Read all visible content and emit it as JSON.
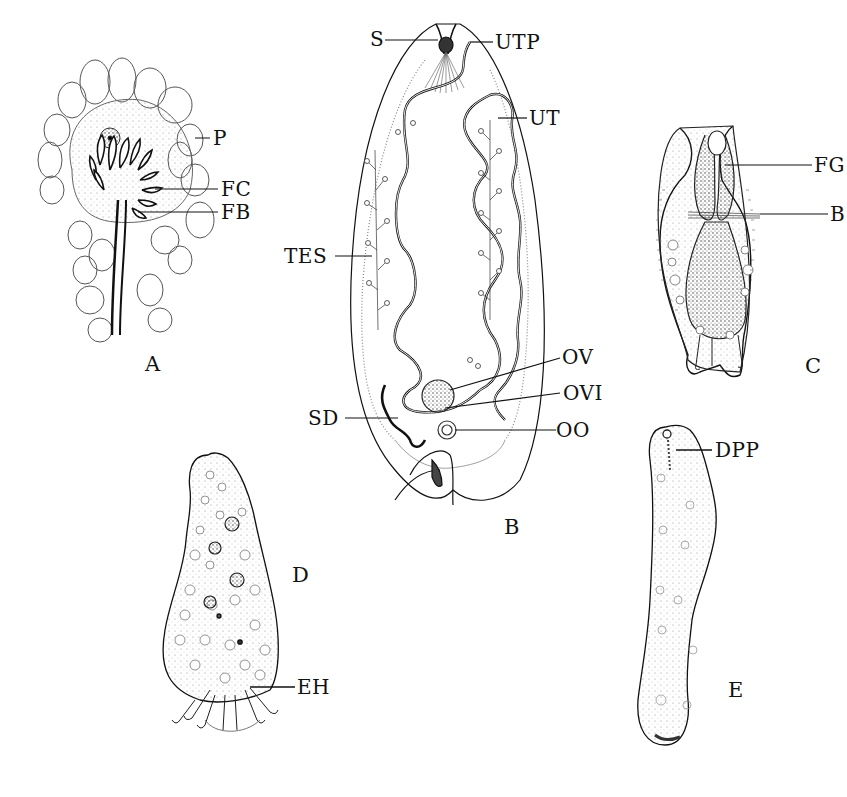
{
  "figure": {
    "ink_color": "#111111",
    "background": "#ffffff",
    "panels": [
      {
        "id": "A",
        "letter": "A",
        "labels": [
          {
            "key": "P",
            "text": "P"
          },
          {
            "key": "FC",
            "text": "FC"
          },
          {
            "key": "FB",
            "text": "FB"
          }
        ]
      },
      {
        "id": "B",
        "letter": "B",
        "labels": [
          {
            "key": "S",
            "text": "S"
          },
          {
            "key": "UTP",
            "text": "UTP"
          },
          {
            "key": "UT",
            "text": "UT"
          },
          {
            "key": "TES",
            "text": "TES"
          },
          {
            "key": "OV",
            "text": "OV"
          },
          {
            "key": "OVI",
            "text": "OVI"
          },
          {
            "key": "SD",
            "text": "SD"
          },
          {
            "key": "OO",
            "text": "OO"
          }
        ]
      },
      {
        "id": "C",
        "letter": "C",
        "labels": [
          {
            "key": "FG",
            "text": "FG"
          },
          {
            "key": "B",
            "text": "B"
          }
        ]
      },
      {
        "id": "D",
        "letter": "D",
        "labels": [
          {
            "key": "EH",
            "text": "EH"
          }
        ]
      },
      {
        "id": "E",
        "letter": "E",
        "labels": [
          {
            "key": "DPP",
            "text": "DPP"
          }
        ]
      }
    ]
  }
}
